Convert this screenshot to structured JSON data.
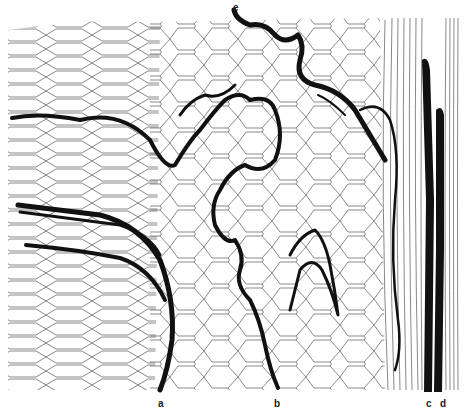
{
  "figure": {
    "type": "histological line drawing",
    "labels": [
      {
        "id": "a",
        "text": "a",
        "x": 158,
        "y": 398
      },
      {
        "id": "b",
        "text": "b",
        "x": 274,
        "y": 398
      },
      {
        "id": "c",
        "text": "c",
        "x": 426,
        "y": 398
      },
      {
        "id": "d",
        "text": "d",
        "x": 440,
        "y": 398
      },
      {
        "id": "e",
        "text": "e",
        "x": 233,
        "y": 4
      }
    ],
    "colors": {
      "ink": "#111111",
      "cell_lines": "#555555",
      "background": "#ffffff"
    }
  }
}
